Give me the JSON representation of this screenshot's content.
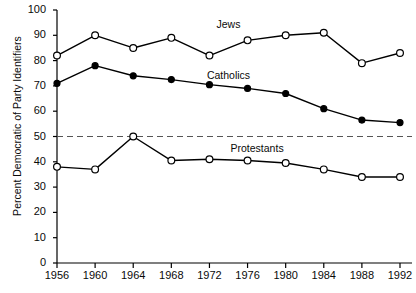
{
  "chart_data": {
    "type": "line",
    "title": "",
    "xlabel": "",
    "ylabel": "Percent Democratic of Party Identifiers",
    "xlim": [
      1956,
      1992
    ],
    "ylim": [
      0,
      100
    ],
    "grid": false,
    "legend_position": "inline-annotations",
    "categories": [
      1956,
      1960,
      1964,
      1968,
      1972,
      1976,
      1980,
      1984,
      1988,
      1992
    ],
    "xtick_labels": [
      "1956",
      "1960",
      "1964",
      "1968",
      "1972",
      "1976",
      "1980",
      "1984",
      "1988",
      "1992"
    ],
    "ytick_labels": [
      "0",
      "10",
      "20",
      "30",
      "40",
      "50",
      "60",
      "70",
      "80",
      "90",
      "100"
    ],
    "ytick_values": [
      0,
      10,
      20,
      30,
      40,
      50,
      60,
      70,
      80,
      90,
      100
    ],
    "reference_line": {
      "value": 50,
      "style": "dashed",
      "label": ""
    },
    "series": [
      {
        "name": "Jews",
        "marker": "open-circle",
        "values": [
          82,
          90,
          85,
          89,
          82,
          88,
          90,
          91,
          79,
          83
        ]
      },
      {
        "name": "Catholics",
        "marker": "filled-circle",
        "values": [
          71,
          78,
          74,
          72.5,
          70.5,
          69,
          67,
          61,
          56.5,
          55.5
        ]
      },
      {
        "name": "Protestants",
        "marker": "open-circle",
        "values": [
          38,
          37,
          50,
          40.5,
          41,
          40.5,
          39.5,
          37,
          34,
          34
        ]
      }
    ],
    "annotations": [
      {
        "text": "Jews",
        "x": 1974,
        "y": 94
      },
      {
        "text": "Catholics",
        "x": 1974,
        "y": 74
      },
      {
        "text": "Protestants",
        "x": 1977,
        "y": 45
      }
    ],
    "colors": {
      "line": "#000000",
      "marker_fill_open": "#ffffff",
      "marker_fill_closed": "#000000",
      "axis": "#000000",
      "reference_line": "#555555",
      "background": "#ffffff"
    }
  }
}
